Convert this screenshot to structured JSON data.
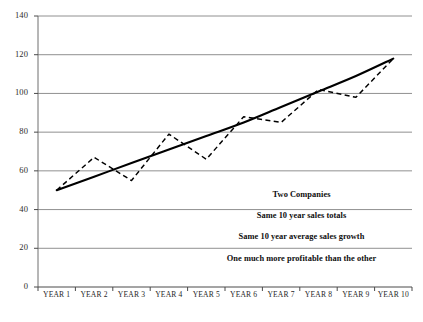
{
  "chart_data": {
    "type": "line",
    "title": "",
    "xlabel": "",
    "ylabel": "",
    "grid": true,
    "legend_position": "none",
    "categories": [
      "YEAR 1",
      "YEAR 2",
      "YEAR 3",
      "YEAR 4",
      "YEAR 5",
      "YEAR 6",
      "YEAR 7",
      "YEAR 8",
      "YEAR 9",
      "YEAR 10"
    ],
    "ylim": [
      0,
      140
    ],
    "yticks": [
      0,
      20,
      40,
      60,
      80,
      100,
      120,
      140
    ],
    "series": [
      {
        "name": "Steady trend (solid)",
        "style": "solid",
        "color": "#000000",
        "values": [
          50,
          57,
          64,
          71,
          78,
          85,
          93,
          101,
          109,
          118
        ]
      },
      {
        "name": "Volatile sales (dashed)",
        "style": "dashed",
        "color": "#000000",
        "values": [
          50,
          67,
          55,
          79,
          66,
          88,
          85,
          102,
          98,
          118
        ]
      }
    ],
    "annotations": [
      "Two Companies",
      "Same 10 year sales totals",
      "Same 10 year average sales growth",
      "One much more profitable than the other"
    ]
  }
}
